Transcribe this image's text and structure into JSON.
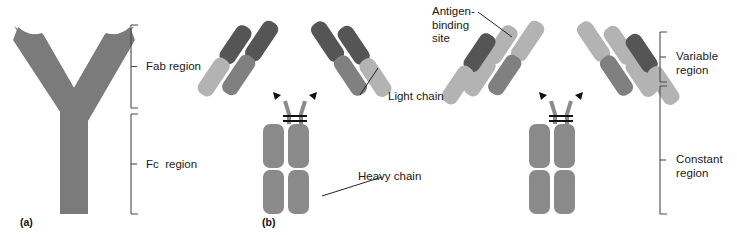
{
  "figure": {
    "background": "#ffffff"
  },
  "colors": {
    "silhouette_gray": "#7b7b7b",
    "dark_gray": "#555555",
    "mid_gray": "#808080",
    "light_gray": "#b3b3b3",
    "stem_gray": "#8a8a8a",
    "line_black": "#1a1a1a",
    "bracket_gray": "#4a4a4a",
    "text": "#181818"
  },
  "panels": [
    {
      "id": "a",
      "label": "(a)",
      "type": "y-silhouette",
      "brackets": [
        {
          "name": "fab",
          "label": "Fab region",
          "y_top": 25,
          "y_bottom": 108
        },
        {
          "name": "fc",
          "label": "Fc  region",
          "y_top": 114,
          "y_bottom": 214
        }
      ]
    },
    {
      "id": "b",
      "label": "(b)",
      "type": "domain-model-chains",
      "callouts": [
        {
          "name": "light-chain",
          "label": "Light chain"
        },
        {
          "name": "heavy-chain",
          "label": "Heavy chain"
        }
      ]
    },
    {
      "id": "c",
      "label": "",
      "type": "domain-model-regions",
      "callouts": [
        {
          "name": "antigen-binding-site",
          "label": "Antigen-\nbinding\nsite"
        }
      ],
      "brackets": [
        {
          "name": "variable",
          "label": "Variable\nregion",
          "y_top": 32,
          "y_bottom": 82
        },
        {
          "name": "constant",
          "label": "Constant\nregion",
          "y_top": 86,
          "y_bottom": 214
        }
      ]
    }
  ],
  "labels": {
    "fab_region": "Fab region",
    "fc_region": "Fc  region",
    "light_chain": "Light chain",
    "heavy_chain": "Heavy chain",
    "antigen_binding_line1": "Antigen-",
    "antigen_binding_line2": "binding",
    "antigen_binding_line3": "site",
    "variable_line1": "Variable",
    "variable_line2": "region",
    "constant_line1": "Constant",
    "constant_line2": "region",
    "panel_a": "(a)",
    "panel_b": "(b)"
  }
}
